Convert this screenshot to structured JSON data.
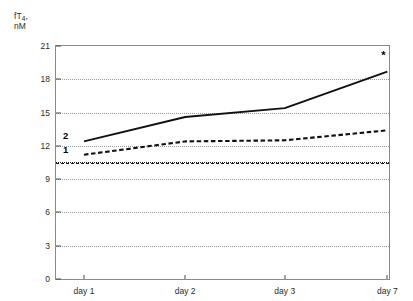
{
  "chart_data": {
    "type": "line",
    "title": "",
    "xlabel": "",
    "ylabel": "fT4, nM",
    "ylabel_lines": [
      "fT4,",
      "nM"
    ],
    "ylabel_prefix": "fT",
    "ylabel_subscript": "4",
    "ylabel_comma": ",",
    "ylabel_units": "nM",
    "categories": [
      "day 1",
      "day 2",
      "day 3",
      "day 7"
    ],
    "x_positions": [
      0.084,
      0.388,
      0.687,
      0.995
    ],
    "ylim": [
      0,
      21
    ],
    "yticks": [
      0,
      3,
      6,
      9,
      12,
      15,
      18,
      21
    ],
    "ytick_labels": [
      "0",
      "3",
      "6",
      "9",
      "12",
      "15",
      "18",
      "21"
    ],
    "grid": true,
    "grid_style": "dotted",
    "legend": "inline",
    "series": [
      {
        "name": "1",
        "label": "1",
        "style": "dashed",
        "color": "#111111",
        "values": [
          11.2,
          12.4,
          12.5,
          13.4
        ]
      },
      {
        "name": "2",
        "label": "2",
        "style": "solid",
        "color": "#111111",
        "values": [
          12.4,
          14.6,
          15.4,
          18.7
        ]
      }
    ],
    "reference_line": {
      "label": "",
      "value": 10.5,
      "style": "dash-dot",
      "color": "#111111"
    },
    "annotations": [
      {
        "text": "*",
        "series": "2",
        "category": "day 7",
        "value": 18.7,
        "offset_value": 1.5
      }
    ]
  },
  "colors": {
    "axis": "#8a8a8a",
    "grid": "#9a9a9a",
    "ink": "#111111",
    "text": "#2b2b2b",
    "background": "#ffffff"
  }
}
